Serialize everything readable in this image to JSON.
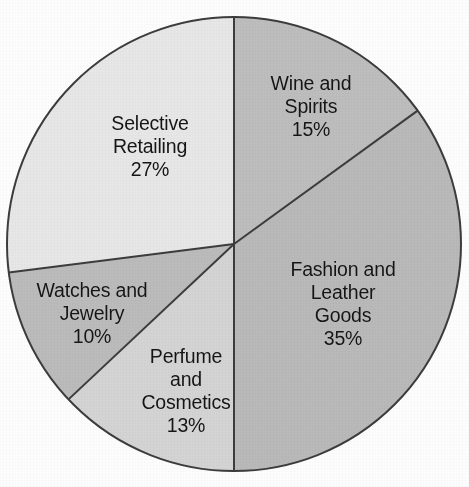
{
  "chart_data": {
    "type": "pie",
    "title": "",
    "subtitle": "",
    "xlabel": "",
    "ylabel": "",
    "legend_position": "none",
    "grid": false,
    "labels_inside_slices": true,
    "start_angle_deg": 0,
    "direction": "clockwise",
    "categories": [
      "Wine and Spirits",
      "Fashion and Leather Goods",
      "Perfume and Cosmetics",
      "Watches and Jewelry",
      "Selective Retailing"
    ],
    "values": [
      15,
      35,
      13,
      10,
      27
    ],
    "total": 100,
    "unit": "%",
    "slices": [
      {
        "name": "Wine and Spirits",
        "value": 15,
        "value_label": "15%",
        "lines": [
          "Wine and",
          "Spirits"
        ],
        "color": "#bdbdbd",
        "start_deg": 0,
        "end_deg": 54
      },
      {
        "name": "Fashion and Leather Goods",
        "value": 35,
        "value_label": "35%",
        "lines": [
          "Fashion and",
          "Leather",
          "Goods"
        ],
        "color": "#b9b9b9",
        "start_deg": 54,
        "end_deg": 180
      },
      {
        "name": "Perfume and Cosmetics",
        "value": 13,
        "value_label": "13%",
        "lines": [
          "Perfume",
          "and",
          "Cosmetics"
        ],
        "color": "#d4d4d4",
        "start_deg": 180,
        "end_deg": 226.8
      },
      {
        "name": "Watches and Jewelry",
        "value": 10,
        "value_label": "10%",
        "lines": [
          "Watches and",
          "Jewelry"
        ],
        "color": "#bbbbbb",
        "start_deg": 226.8,
        "end_deg": 262.8
      },
      {
        "name": "Selective Retailing",
        "value": 27,
        "value_label": "27%",
        "lines": [
          "Selective",
          "Retailing"
        ],
        "color": "#e7e7e7",
        "start_deg": 262.8,
        "end_deg": 360
      }
    ],
    "geometry": {
      "center_x": 234,
      "center_y": 244,
      "radius": 227
    },
    "style": {
      "outline_color": "#3c3c3c",
      "outline_width": 2,
      "divider_color": "#3c3c3c",
      "divider_width": 2,
      "background": "#fdfdfd",
      "label_color": "#151515"
    }
  }
}
